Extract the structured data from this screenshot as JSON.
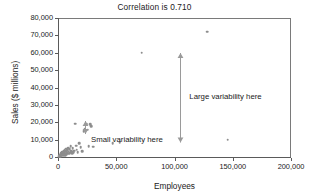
{
  "chart_data": {
    "type": "scatter",
    "title": "Correlation is 0.710",
    "xlabel": "Employees",
    "ylabel": "Sales ($ millions)",
    "xlim": [
      0,
      200000
    ],
    "ylim": [
      0,
      80000
    ],
    "xticks": [
      0,
      50000,
      100000,
      150000,
      200000
    ],
    "xticklabels": [
      "0",
      "50,000",
      "100,000",
      "150,000",
      "200,000"
    ],
    "yticks": [
      0,
      10000,
      20000,
      30000,
      40000,
      50000,
      60000,
      70000,
      80000
    ],
    "yticklabels": [
      "0",
      "10,000",
      "20,000",
      "30,000",
      "40,000",
      "50,000",
      "60,000",
      "70,000",
      "80,000"
    ],
    "grid": false,
    "legend": false,
    "marker_color": "#8d8d8d",
    "correlation": 0.71,
    "points": [
      [
        1200,
        600
      ],
      [
        1600,
        900
      ],
      [
        2000,
        1200
      ],
      [
        2300,
        500
      ],
      [
        2600,
        1700
      ],
      [
        2900,
        2100
      ],
      [
        3100,
        800
      ],
      [
        3400,
        2600
      ],
      [
        3600,
        1400
      ],
      [
        3900,
        3100
      ],
      [
        4100,
        1900
      ],
      [
        4400,
        900
      ],
      [
        4700,
        2400
      ],
      [
        5000,
        3600
      ],
      [
        5200,
        1500
      ],
      [
        5500,
        2800
      ],
      [
        5800,
        4200
      ],
      [
        6100,
        1100
      ],
      [
        6400,
        3300
      ],
      [
        6700,
        2000
      ],
      [
        7000,
        4800
      ],
      [
        7300,
        2700
      ],
      [
        7600,
        1600
      ],
      [
        7900,
        3900
      ],
      [
        8300,
        2300
      ],
      [
        8700,
        5200
      ],
      [
        9100,
        3000
      ],
      [
        9500,
        1800
      ],
      [
        9900,
        4400
      ],
      [
        10400,
        2500
      ],
      [
        10900,
        6100
      ],
      [
        11400,
        3400
      ],
      [
        12000,
        2100
      ],
      [
        12600,
        5000
      ],
      [
        13200,
        2900
      ],
      [
        13900,
        3700
      ],
      [
        14600,
        19200
      ],
      [
        15400,
        6400
      ],
      [
        16200,
        4100
      ],
      [
        17000,
        2600
      ],
      [
        18200,
        8100
      ],
      [
        19500,
        5500
      ],
      [
        20800,
        3200
      ],
      [
        22100,
        14800
      ],
      [
        23000,
        16200
      ],
      [
        23800,
        18600
      ],
      [
        24600,
        19000
      ],
      [
        25400,
        15600
      ],
      [
        26200,
        6200
      ],
      [
        27400,
        18900
      ],
      [
        28600,
        17800
      ],
      [
        30200,
        5900
      ],
      [
        47000,
        8100
      ],
      [
        52800,
        8600
      ],
      [
        72000,
        60100
      ],
      [
        128000,
        72000
      ],
      [
        145500,
        10000
      ]
    ],
    "annotations": [
      {
        "name": "large-variability",
        "text": "Large variability here",
        "x": 105000,
        "y_from": 8500,
        "y_to": 60000
      },
      {
        "name": "small-variability",
        "text": "Small variability here",
        "x": 24000,
        "y_from": 13000,
        "y_to": 20500
      }
    ]
  }
}
